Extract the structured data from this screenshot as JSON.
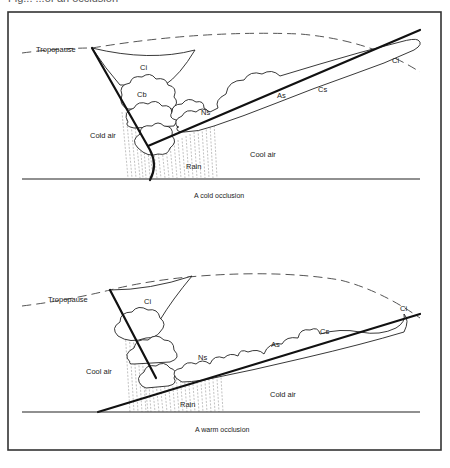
{
  "figure": {
    "caption_cropped": "Fig... ...of an occlusion",
    "frame_color": "#333333"
  },
  "diagrams": [
    {
      "id": "cold-occlusion",
      "caption": "A cold occlusion",
      "labels": {
        "tropopause": "Tropopause",
        "ci_anvil": "Ci",
        "cb": "Cb",
        "ns": "Ns",
        "as": "As",
        "cs": "Cs",
        "ci_end": "Ci",
        "left_air": "Cold air",
        "right_air": "Cool air",
        "rain": "Rain"
      }
    },
    {
      "id": "warm-occlusion",
      "caption": "A warm occlusion",
      "labels": {
        "tropopause": "Tropopause",
        "ci_anvil": "Ci",
        "ns": "Ns",
        "as": "As",
        "cs": "Cs",
        "ci_end": "Ci",
        "left_air": "Cool air",
        "right_air": "Cold air",
        "rain": "Rain"
      }
    }
  ]
}
